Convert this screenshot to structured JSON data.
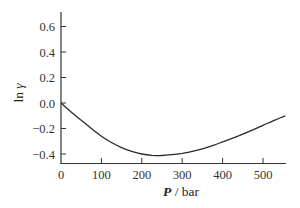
{
  "chart_data": {
    "type": "line",
    "title": "",
    "xlabel": "P / bar",
    "xlabel_italic_part": "P",
    "xlabel_unit_part": " / bar",
    "ylabel": "ln γ",
    "ylabel_prefix": "ln ",
    "ylabel_symbol": "γ",
    "xlim": [
      0,
      555
    ],
    "ylim": [
      -0.47,
      0.72
    ],
    "x_ticks": [
      0,
      100,
      200,
      300,
      400,
      500
    ],
    "x_tick_labels": [
      "0",
      "100",
      "200",
      "300",
      "400",
      "500"
    ],
    "y_ticks": [
      -0.4,
      -0.2,
      0.0,
      0.2,
      0.4,
      0.6
    ],
    "y_tick_labels": [
      "−0.4",
      "−0.2",
      "0.0",
      "0.2",
      "0.4",
      "0.6"
    ],
    "grid": false,
    "legend": null,
    "series": [
      {
        "name": "ln γ vs P",
        "color": "#2a2a2a",
        "x": [
          0,
          25,
          50,
          75,
          100,
          125,
          150,
          175,
          200,
          225,
          250,
          275,
          300,
          325,
          350,
          375,
          400,
          425,
          450,
          475,
          500,
          525,
          555
        ],
        "y": [
          0.0,
          -0.07,
          -0.135,
          -0.2,
          -0.26,
          -0.31,
          -0.35,
          -0.38,
          -0.4,
          -0.41,
          -0.412,
          -0.405,
          -0.395,
          -0.38,
          -0.36,
          -0.335,
          -0.305,
          -0.275,
          -0.245,
          -0.21,
          -0.175,
          -0.14,
          -0.1
        ]
      }
    ]
  }
}
